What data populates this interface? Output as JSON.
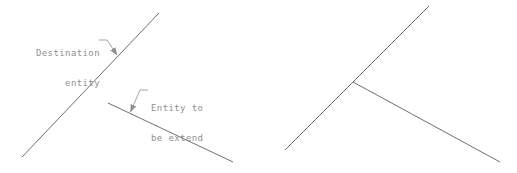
{
  "colors": {
    "line": "#6f6f6f",
    "leader": "#8f8f8f",
    "text": "#8f8f8f",
    "background": "#ffffff"
  },
  "labels": {
    "destination": {
      "line1": "Destination",
      "line2": "entity"
    },
    "extend": {
      "line1": "Entity to",
      "line2": "be extend"
    }
  },
  "geometry": {
    "before": {
      "destination_line_points": "22,157 159,13",
      "entity_to_extend_points": "108,103 233,162",
      "leader_destination_points": "99,40 107,40 117,55",
      "leader_extend_points": "148,90 140,90 130.5,112"
    },
    "after": {
      "destination_line_points": "285,150 429,6",
      "extended_entity_points": "353,82 500,162"
    }
  }
}
